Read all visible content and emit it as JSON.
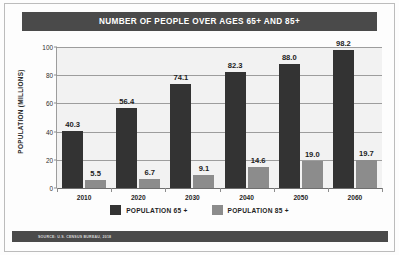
{
  "title": "NUMBER OF PEOPLE OVER AGES 65+ AND 85+",
  "source_note": "SOURCE: U.S. CENSUS BUREAU, 2018",
  "legend": {
    "items": [
      {
        "label": "POPULATION  65 +",
        "color": "#333333"
      },
      {
        "label": "POPULATION  85 +",
        "color": "#8c8c8c"
      }
    ]
  },
  "chart_data": {
    "type": "bar",
    "title": "NUMBER OF PEOPLE OVER AGES 65+ AND 85+",
    "xlabel": "",
    "ylabel": "POPULATION (MILLIONS)",
    "ylim": [
      0,
      100
    ],
    "yticks": [
      0,
      20,
      40,
      60,
      80,
      100
    ],
    "ytick_labels": [
      "0",
      "20",
      "40",
      "60",
      "80",
      "100"
    ],
    "categories": [
      "2010",
      "2020",
      "2030",
      "2040",
      "2050",
      "2060"
    ],
    "grid": true,
    "legend_position": "bottom-center",
    "series": [
      {
        "name": "POPULATION  65 +",
        "color": "#333333",
        "values": [
          40.3,
          56.4,
          74.1,
          82.3,
          88.0,
          98.2
        ],
        "labels": [
          "40.3",
          "56.4",
          "74.1",
          "82.3",
          "88.0",
          "98.2"
        ]
      },
      {
        "name": "POPULATION  85 +",
        "color": "#8c8c8c",
        "values": [
          5.5,
          6.7,
          9.1,
          14.6,
          19.0,
          19.7
        ],
        "labels": [
          "5.5",
          "6.7",
          "9.1",
          "14.6",
          "19.0",
          "19.7"
        ]
      }
    ]
  }
}
